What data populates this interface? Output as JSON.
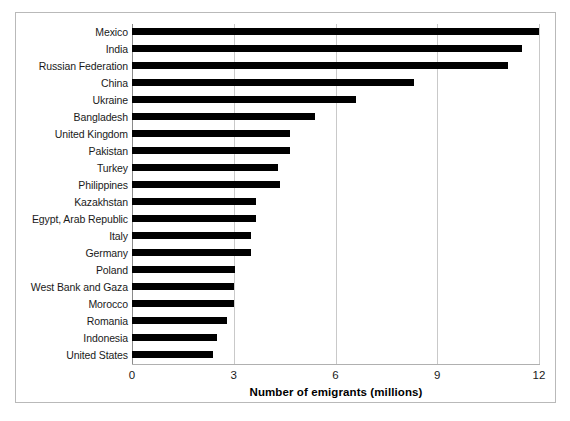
{
  "chart_data": {
    "type": "bar",
    "orientation": "horizontal",
    "title": "",
    "subtitle": "",
    "xlabel": "Number of emigrants (millions)",
    "ylabel": "",
    "xlim": [
      0,
      12
    ],
    "xticks": [
      "0",
      "3",
      "6",
      "9",
      "12"
    ],
    "xtick_values": [
      0,
      3,
      6,
      9,
      12
    ],
    "grid": "vertical",
    "legend": "none",
    "bar_color": "#000000",
    "categories": [
      "Mexico",
      "India",
      "Russian Federation",
      "China",
      "Ukraine",
      "Bangladesh",
      "United Kingdom",
      "Pakistan",
      "Turkey",
      "Philippines",
      "Kazakhstan",
      "Egypt, Arab Republic",
      "Italy",
      "Germany",
      "Poland",
      "West Bank and Gaza",
      "Morocco",
      "Romania",
      "Indonesia",
      "United States"
    ],
    "values": [
      12.0,
      11.5,
      11.1,
      8.3,
      6.6,
      5.4,
      4.65,
      4.65,
      4.3,
      4.35,
      3.65,
      3.65,
      3.5,
      3.5,
      3.05,
      3.0,
      3.0,
      2.8,
      2.5,
      2.4
    ]
  },
  "colors": {
    "bar": "#000000",
    "grid": "#c9c9c9",
    "axis": "#8a8a8a",
    "frame": "#b9b9b9",
    "text": "#1a1a1a"
  }
}
